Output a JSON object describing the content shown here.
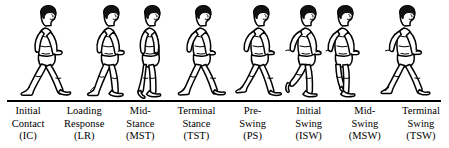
{
  "figure": {
    "type": "gait-cycle-diagram",
    "ground_line": {
      "color": "#000000",
      "present": true
    },
    "colors": {
      "background": "#ffffff",
      "ink": "#000000",
      "hair": "#111111"
    },
    "phases": [
      {
        "index": 1,
        "name_line1": "Initial",
        "name_line2": "Contact",
        "abbreviation": "(IC)",
        "abbr_plain": "IC",
        "pose": "wide double support, lead heel strikes ground, trailing toe on ground"
      },
      {
        "index": 2,
        "name_line1": "Loading",
        "name_line2": "Response",
        "abbreviation": "(LR)",
        "abbr_plain": "LR",
        "pose": "lead foot flat, weight accepted, trailing leg behind with toe off"
      },
      {
        "index": 3,
        "name_line1": "Mid-",
        "name_line2": "Stance",
        "abbreviation": "(MST)",
        "abbr_plain": "MST",
        "pose": "single limb support, legs nearly together, body vertical over stance foot"
      },
      {
        "index": 4,
        "name_line1": "Terminal",
        "name_line2": "Stance",
        "abbreviation": "(TST)",
        "abbr_plain": "TST",
        "pose": "stance heel rises, opposite leg swings forward ahead of body"
      },
      {
        "index": 5,
        "name_line1": "Pre-",
        "name_line2": "Swing",
        "abbreviation": "(PS)",
        "abbr_plain": "PS",
        "pose": "trailing toe pushes off, contralateral foot making contact ahead"
      },
      {
        "index": 6,
        "name_line1": "Initial",
        "name_line2": "Swing",
        "abbreviation": "(ISW)",
        "abbr_plain": "ISW",
        "pose": "swing limb lifts off ground, knee strongly flexed behind body"
      },
      {
        "index": 7,
        "name_line1": "Mid-",
        "name_line2": "Swing",
        "abbreviation": "(MSW)",
        "abbr_plain": "MSW",
        "pose": "swing limb passes vertical beside stance limb, foot clears ground"
      },
      {
        "index": 8,
        "name_line1": "Terminal",
        "name_line2": "Swing",
        "abbreviation": "(TSW)",
        "abbr_plain": "TSW",
        "pose": "swing leg extends forward, knee straightening before heel contact"
      }
    ]
  }
}
